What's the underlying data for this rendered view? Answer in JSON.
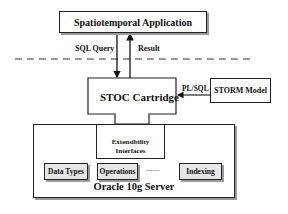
{
  "diagram": {
    "application": {
      "label": "Spatiotemporal Application"
    },
    "query_edge": {
      "label": "SQL Query"
    },
    "result_edge": {
      "label": "Result"
    },
    "cartridge": {
      "label": "STOC Cartridge"
    },
    "storm": {
      "label": "STORM Model"
    },
    "plsql_edge": {
      "label": "PL/SQL"
    },
    "extensibility": {
      "line1": "Extensibility",
      "line2": "Interfaces"
    },
    "server": {
      "label": "Oracle 10g Server",
      "components": [
        {
          "label": "Data Types"
        },
        {
          "label": "Operations"
        },
        {
          "label": "......."
        },
        {
          "label": "Indexing"
        }
      ]
    }
  },
  "colors": {
    "stroke": "#222222",
    "shadow": "#9a9a9a",
    "component_fill": "#e6e6e6",
    "background": "#ffffff"
  }
}
